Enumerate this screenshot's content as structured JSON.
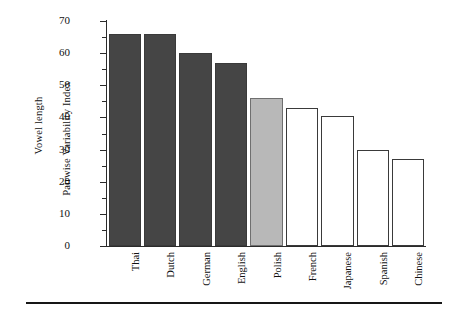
{
  "chart_data": {
    "type": "bar",
    "title": "",
    "xlabel": "",
    "ylabel": "Vowel length Pairwise Variability Index",
    "ylabel_lines": [
      "Vowel length",
      "Pairwise Variability Index"
    ],
    "categories": [
      "Thai",
      "Dutch",
      "German",
      "English",
      "Polish",
      "French",
      "Japanese",
      "Spanish",
      "Chinese"
    ],
    "values": [
      66,
      66,
      60,
      57,
      46,
      43,
      40.5,
      30,
      27
    ],
    "ylim": [
      0,
      70
    ],
    "ytick_major": [
      0,
      10,
      20,
      30,
      40,
      50,
      60,
      70
    ],
    "ytick_minor": [
      5,
      15,
      25,
      35,
      45,
      55,
      65
    ],
    "grid": false,
    "legend": "none",
    "bar_styles": [
      "dark",
      "dark",
      "dark",
      "dark",
      "light",
      "open",
      "open",
      "open",
      "open"
    ],
    "colors": {
      "dark": "#454545",
      "light": "#b8b8b8",
      "open": "#ffffff",
      "outline": "#3a3a3a",
      "axis": "#2b2b2b",
      "rule": "#171717"
    }
  }
}
